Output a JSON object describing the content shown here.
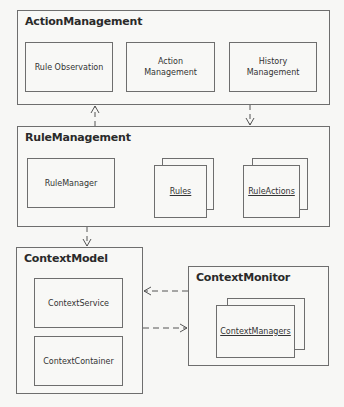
{
  "packages": {
    "action_management": {
      "title": "ActionManagement",
      "components": [
        "Rule Observation",
        "Action\nManagement",
        "History\nManagement"
      ]
    },
    "rule_management": {
      "title": "RuleManagement",
      "components": [
        "RuleManager",
        "Rules",
        "RuleActions"
      ]
    },
    "context_model": {
      "title": "ContextModel",
      "components": [
        "ContextService",
        "ContextContainer"
      ]
    },
    "context_monitor": {
      "title": "ContextMonitor",
      "components": [
        "ContextManagers"
      ]
    }
  },
  "colors": {
    "border": "#6e6e6e",
    "background": "#f7f7f5",
    "text": "#2a2a2a"
  }
}
